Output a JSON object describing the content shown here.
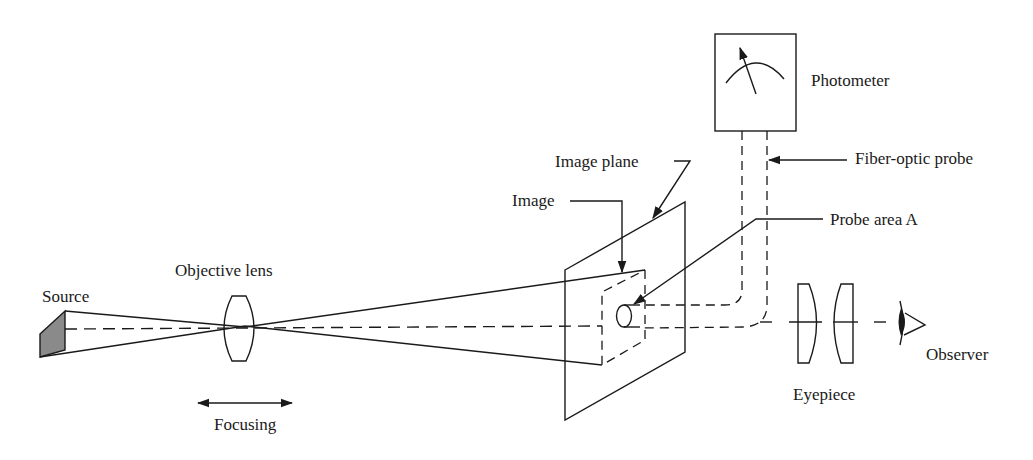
{
  "figure": {
    "type": "optical-schematic"
  },
  "labels": {
    "source": "Source",
    "objective_lens": "Objective lens",
    "focusing": "Focusing",
    "image_plane": "Image plane",
    "image": "Image",
    "photometer": "Photometer",
    "fiber_optic_probe": "Fiber-optic probe",
    "probe_area": "Probe area A",
    "eyepiece": "Eyepiece",
    "observer": "Observer"
  },
  "components": [
    {
      "id": "source",
      "label": "Source",
      "shape": "shaded-block"
    },
    {
      "id": "objective-lens",
      "label": "Objective lens",
      "shape": "biconvex-lens"
    },
    {
      "id": "focusing-arrow",
      "label": "Focusing",
      "shape": "double-arrow"
    },
    {
      "id": "image-plane",
      "label": "Image plane",
      "shape": "parallelogram"
    },
    {
      "id": "image",
      "label": "Image",
      "shape": "dashed-parallelogram"
    },
    {
      "id": "probe-area",
      "label": "Probe area A",
      "shape": "cylinder-end"
    },
    {
      "id": "fiber-optic-probe",
      "label": "Fiber-optic probe",
      "shape": "dashed-bent-tube"
    },
    {
      "id": "photometer",
      "label": "Photometer",
      "shape": "meter-box"
    },
    {
      "id": "eyepiece",
      "label": "Eyepiece",
      "shape": "two-plano-convex-lenses"
    },
    {
      "id": "observer",
      "label": "Observer",
      "shape": "eye"
    }
  ],
  "colors": {
    "line": "#1a1a1a",
    "source_fill": "#8a8a8a",
    "background": "#ffffff"
  }
}
